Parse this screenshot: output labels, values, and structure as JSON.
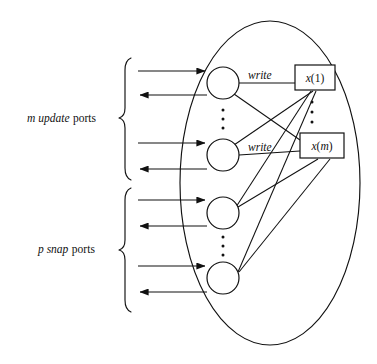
{
  "figure": {
    "background_color": "#ffffff",
    "line_color": "#111111"
  },
  "groups": [
    {
      "id": "update-group",
      "label_italic": "m update",
      "label_plain": "ports",
      "brace": "left-curly-brace",
      "port_count_symbol": "m",
      "port_kind": "update"
    },
    {
      "id": "snap-group",
      "label_italic": "p snap",
      "label_plain": "ports",
      "brace": "left-curly-brace",
      "port_count_symbol": "p",
      "port_kind": "snap"
    }
  ],
  "nodes": [
    {
      "id": "proc-1",
      "shape": "circle",
      "group": "update-group",
      "cx": 223,
      "cy": 83,
      "r": 16
    },
    {
      "id": "proc-2",
      "shape": "circle",
      "group": "update-group",
      "cx": 223,
      "cy": 155,
      "r": 16
    },
    {
      "id": "proc-3",
      "shape": "circle",
      "group": "snap-group",
      "cx": 223,
      "cy": 213,
      "r": 16
    },
    {
      "id": "proc-4",
      "shape": "circle",
      "group": "snap-group",
      "cx": 223,
      "cy": 278,
      "r": 16
    }
  ],
  "registers": [
    {
      "id": "register-x1",
      "label": "x(1)",
      "shape": "rectangle",
      "x": 295,
      "y": 65,
      "w": 40,
      "h": 25
    },
    {
      "id": "register-xm",
      "label": "x(m)",
      "shape": "rectangle",
      "x": 300,
      "y": 133,
      "w": 44,
      "h": 25
    }
  ],
  "edge_labels": [
    {
      "id": "write-label-1",
      "text": "write",
      "x": 248,
      "y": 78
    },
    {
      "id": "write-label-2",
      "text": "write",
      "x": 248,
      "y": 150
    }
  ],
  "vertical_ellipsis": [
    {
      "id": "ellipsis-processes-update",
      "x": 223,
      "y": 119,
      "count": 3
    },
    {
      "id": "ellipsis-registers",
      "x": 312,
      "y": 112,
      "count": 3
    },
    {
      "id": "ellipsis-processes-snap",
      "x": 223,
      "y": 245,
      "count": 3
    }
  ],
  "boundary": {
    "id": "object-boundary",
    "shape": "ellipse",
    "cx": 270,
    "cy": 183,
    "rx": 90,
    "ry": 162
  },
  "ports": [
    {
      "id": "port-in-1",
      "direction": "in",
      "y": 71,
      "x_start": 138,
      "x_end": 207
    },
    {
      "id": "port-out-1",
      "direction": "out",
      "y": 95,
      "x_start": 138,
      "x_end": 207
    },
    {
      "id": "port-in-2",
      "direction": "in",
      "y": 143,
      "x_start": 138,
      "x_end": 207
    },
    {
      "id": "port-out-2",
      "direction": "out",
      "y": 169,
      "x_start": 138,
      "x_end": 207
    },
    {
      "id": "port-in-3",
      "direction": "in",
      "y": 200,
      "x_start": 138,
      "x_end": 207
    },
    {
      "id": "port-out-3",
      "direction": "out",
      "y": 226,
      "x_start": 138,
      "x_end": 207
    },
    {
      "id": "port-in-4",
      "direction": "in",
      "y": 266,
      "x_start": 138,
      "x_end": 207
    },
    {
      "id": "port-out-4",
      "direction": "out",
      "y": 292,
      "x_start": 138,
      "x_end": 207
    }
  ],
  "connections": [
    {
      "from": "proc-1",
      "to": "register-x1",
      "kind": "write"
    },
    {
      "from": "proc-2",
      "to": "register-xm",
      "kind": "write"
    },
    {
      "from": "proc-2",
      "to": "register-x1",
      "kind": "read"
    },
    {
      "from": "proc-3",
      "to": "register-x1",
      "kind": "read"
    },
    {
      "from": "proc-3",
      "to": "register-xm",
      "kind": "read"
    },
    {
      "from": "proc-4",
      "to": "register-x1",
      "kind": "read"
    },
    {
      "from": "proc-4",
      "to": "register-xm",
      "kind": "read"
    }
  ]
}
